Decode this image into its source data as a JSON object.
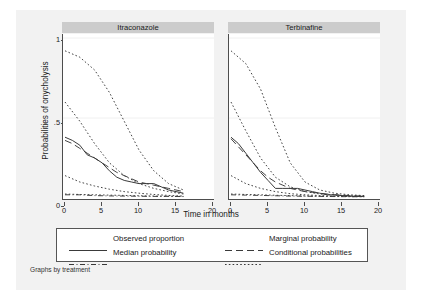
{
  "figure": {
    "note": "Graphs by treatment",
    "bg_color": "#f2f2f2",
    "plot_bg_color": "#ffffff",
    "panel_title_bg": "#cccccc",
    "axis_color": "#4d4d4d"
  },
  "chart_data": {
    "type": "line",
    "title": "",
    "xlabel": "Time in months",
    "ylabel": "Probabilities of onycholysis",
    "xlim": [
      0,
      20
    ],
    "ylim": [
      0,
      1
    ],
    "xticks": [
      0,
      5,
      10,
      15,
      20
    ],
    "xticklabels": [
      "0",
      "5",
      "10",
      "15",
      "20"
    ],
    "yticks": [
      0,
      0.5,
      1
    ],
    "yticklabels": [
      "0",
      ".5",
      "1"
    ],
    "grid": false,
    "legend_position": "bottom",
    "legend": [
      {
        "label": "Observed proportion",
        "style": "solid"
      },
      {
        "label": "Marginal probability",
        "style": "long-dash"
      },
      {
        "label": "Median probability",
        "style": "dash-dot"
      },
      {
        "label": "Conditional probabilities",
        "style": "dotted"
      }
    ],
    "panels": [
      {
        "title": "Itraconazole",
        "series": [
          {
            "name": "Observed proportion",
            "style": "solid",
            "x": [
              0,
              1,
              2,
              3,
              4,
              5,
              6,
              7,
              8,
              9,
              10,
              11,
              12,
              13,
              14,
              15,
              16
            ],
            "y": [
              0.38,
              0.36,
              0.33,
              0.27,
              0.25,
              0.22,
              0.17,
              0.13,
              0.11,
              0.1,
              0.09,
              0.09,
              0.09,
              0.07,
              0.05,
              0.04,
              0.03
            ]
          },
          {
            "name": "Marginal probability",
            "style": "long-dash",
            "x": [
              0,
              1,
              2,
              3,
              4,
              5,
              6,
              7,
              8,
              9,
              10,
              11,
              12,
              13,
              14,
              15,
              16
            ],
            "y": [
              0.36,
              0.34,
              0.31,
              0.28,
              0.25,
              0.22,
              0.19,
              0.16,
              0.14,
              0.12,
              0.1,
              0.09,
              0.08,
              0.07,
              0.06,
              0.05,
              0.04
            ]
          },
          {
            "name": "Median probability",
            "style": "dash-dot",
            "x": [
              0,
              2,
              4,
              6,
              8,
              10,
              12,
              14,
              16
            ],
            "y": [
              0.02,
              0.02,
              0.015,
              0.013,
              0.012,
              0.011,
              0.01,
              0.01,
              0.009
            ]
          },
          {
            "name": "Conditional probability high",
            "style": "dotted",
            "x": [
              0,
              2,
              4,
              6,
              8,
              10,
              12,
              14,
              16
            ],
            "y": [
              0.92,
              0.88,
              0.8,
              0.66,
              0.48,
              0.3,
              0.17,
              0.09,
              0.05
            ]
          },
          {
            "name": "Conditional probability mid",
            "style": "dotted",
            "x": [
              0,
              2,
              4,
              6,
              8,
              10,
              12,
              14,
              16
            ],
            "y": [
              0.6,
              0.48,
              0.34,
              0.22,
              0.14,
              0.09,
              0.06,
              0.04,
              0.025
            ]
          },
          {
            "name": "Conditional probability low",
            "style": "dotted",
            "x": [
              0,
              2,
              4,
              6,
              8,
              10,
              12,
              14,
              16
            ],
            "y": [
              0.14,
              0.1,
              0.075,
              0.055,
              0.04,
              0.03,
              0.022,
              0.016,
              0.012
            ]
          },
          {
            "name": "Conditional probability lowest",
            "style": "dotted",
            "x": [
              0,
              2,
              4,
              6,
              8,
              10,
              12,
              14,
              16
            ],
            "y": [
              0.025,
              0.022,
              0.02,
              0.018,
              0.016,
              0.014,
              0.012,
              0.011,
              0.01
            ]
          }
        ]
      },
      {
        "title": "Terbinafine",
        "series": [
          {
            "name": "Observed proportion",
            "style": "solid",
            "x": [
              0,
              1,
              2,
              3,
              4,
              5,
              6,
              7,
              8,
              9,
              10,
              11,
              12,
              13,
              14,
              15,
              16,
              17,
              18
            ],
            "y": [
              0.38,
              0.34,
              0.28,
              0.22,
              0.16,
              0.11,
              0.06,
              0.06,
              0.06,
              0.06,
              0.05,
              0.04,
              0.03,
              0.02,
              0.02,
              0.015,
              0.012,
              0.01,
              0.01
            ]
          },
          {
            "name": "Marginal probability",
            "style": "long-dash",
            "x": [
              0,
              1,
              2,
              3,
              4,
              5,
              6,
              7,
              8,
              9,
              10,
              11,
              12,
              13,
              14,
              15,
              16,
              17,
              18
            ],
            "y": [
              0.37,
              0.32,
              0.27,
              0.22,
              0.17,
              0.13,
              0.1,
              0.08,
              0.06,
              0.05,
              0.04,
              0.035,
              0.03,
              0.025,
              0.02,
              0.018,
              0.015,
              0.013,
              0.012
            ]
          },
          {
            "name": "Median probability",
            "style": "dash-dot",
            "x": [
              0,
              2,
              4,
              6,
              8,
              10,
              12,
              14,
              16,
              18
            ],
            "y": [
              0.02,
              0.018,
              0.016,
              0.014,
              0.012,
              0.011,
              0.01,
              0.009,
              0.008,
              0.008
            ]
          },
          {
            "name": "Conditional probability high",
            "style": "dotted",
            "x": [
              0,
              2,
              4,
              6,
              8,
              10,
              12,
              14,
              16,
              18
            ],
            "y": [
              0.92,
              0.84,
              0.68,
              0.44,
              0.22,
              0.1,
              0.05,
              0.03,
              0.02,
              0.015
            ]
          },
          {
            "name": "Conditional probability mid",
            "style": "dotted",
            "x": [
              0,
              2,
              4,
              6,
              8,
              10,
              12,
              14,
              16,
              18
            ],
            "y": [
              0.6,
              0.42,
              0.25,
              0.13,
              0.07,
              0.04,
              0.025,
              0.018,
              0.014,
              0.012
            ]
          },
          {
            "name": "Conditional probability low",
            "style": "dotted",
            "x": [
              0,
              2,
              4,
              6,
              8,
              10,
              12,
              14,
              16,
              18
            ],
            "y": [
              0.14,
              0.09,
              0.06,
              0.04,
              0.027,
              0.02,
              0.015,
              0.012,
              0.01,
              0.009
            ]
          },
          {
            "name": "Conditional probability lowest",
            "style": "dotted",
            "x": [
              0,
              2,
              4,
              6,
              8,
              10,
              12,
              14,
              16,
              18
            ],
            "y": [
              0.025,
              0.022,
              0.02,
              0.017,
              0.015,
              0.013,
              0.011,
              0.01,
              0.009,
              0.008
            ]
          }
        ]
      }
    ]
  }
}
